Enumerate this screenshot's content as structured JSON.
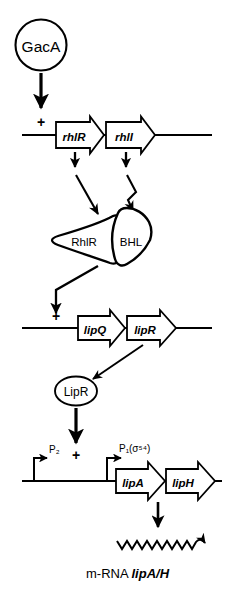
{
  "diagram": {
    "ink_color": "#000000",
    "background_color": "#ffffff"
  },
  "nodes": {
    "gaca": {
      "label": "GacA",
      "shape": "circle"
    },
    "complex": {
      "left_label": "RhlR",
      "right_label": "BHL",
      "shape": "interlocking-wedges"
    },
    "lipr_protein": {
      "label": "LipR",
      "shape": "ellipse"
    }
  },
  "operons": {
    "rhl": {
      "activation_sign": "+",
      "genes": [
        {
          "label": "rhlR"
        },
        {
          "label": "rhlI"
        }
      ]
    },
    "lip_regulatory": {
      "activation_sign": "+",
      "genes": [
        {
          "label": "lipQ"
        },
        {
          "label": "lipR"
        }
      ]
    },
    "lip_structural": {
      "activation_sign": "+",
      "promoters": [
        {
          "label": "P",
          "subscript": "2",
          "sigma": ""
        },
        {
          "label": "P",
          "subscript": "1",
          "sigma": "(σ⁵⁴)"
        }
      ],
      "genes": [
        {
          "label": "lipA"
        },
        {
          "label": "lipH"
        }
      ]
    }
  },
  "transcript": {
    "label_prefix": "m-RNA ",
    "label_gene": "lipA/H",
    "shape": "zigzag-wave"
  },
  "promoter_text": {
    "p2_full": "P₂",
    "p1_full": "P₁(σ⁵⁴)"
  }
}
